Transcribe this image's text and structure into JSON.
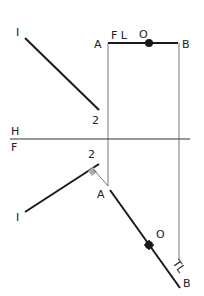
{
  "diagram": {
    "type": "descriptive geometry projection",
    "labels": {
      "top_1": "I",
      "top_2": "2",
      "top_A": "A",
      "top_FL": "F L",
      "top_O": "O",
      "top_B": "B",
      "fold_H": "H",
      "fold_F": "F",
      "bot_2": "2",
      "bot_1": "I",
      "bot_A": "A",
      "bot_O": "O",
      "bot_TL": "TL",
      "bot_B": "B"
    },
    "colors": {
      "line": "#1a1a1a",
      "thin_line": "#555555",
      "right_angle_fill": "#aaaaaa"
    }
  }
}
